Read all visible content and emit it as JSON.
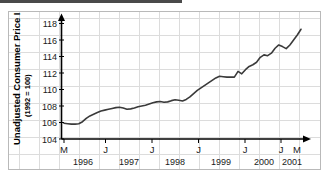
{
  "chart_data": {
    "type": "line",
    "title": "",
    "xlabel": "",
    "ylabel": "Unadjusted Consumer Price Index",
    "ylabel_sub": "(1992 = 100)",
    "ylim": [
      104,
      118
    ],
    "yticks": [
      104,
      106,
      108,
      110,
      112,
      114,
      116,
      118
    ],
    "ytick_labels": [
      "104",
      "106",
      "108",
      "110",
      "112",
      "114",
      "116",
      "118"
    ],
    "grid": true,
    "legend": "none",
    "x_start_label": "M",
    "x_end_label": "M",
    "xtick_labels": [
      "M",
      "J",
      "J",
      "J",
      "J",
      "J",
      "M"
    ],
    "xyear_labels": [
      "1996",
      "1997",
      "1998",
      "1999",
      "2000",
      "2001"
    ],
    "x_axis_note": "Monthly observations from May 1996 through May 2001; M = May, J = January",
    "x_months": [
      "1996-05",
      "1996-06",
      "1996-07",
      "1996-08",
      "1996-09",
      "1996-10",
      "1996-11",
      "1996-12",
      "1997-01",
      "1997-02",
      "1997-03",
      "1997-04",
      "1997-05",
      "1997-06",
      "1997-07",
      "1997-08",
      "1997-09",
      "1997-10",
      "1997-11",
      "1997-12",
      "1998-01",
      "1998-02",
      "1998-03",
      "1998-04",
      "1998-05",
      "1998-06",
      "1998-07",
      "1998-08",
      "1998-09",
      "1998-10",
      "1998-11",
      "1998-12",
      "1999-01",
      "1999-02",
      "1999-03",
      "1999-04",
      "1999-05",
      "1999-06",
      "1999-07",
      "1999-08",
      "1999-09",
      "1999-10",
      "1999-11",
      "1999-12",
      "2000-01",
      "2000-02",
      "2000-03",
      "2000-04",
      "2000-05",
      "2000-06",
      "2000-07",
      "2000-08",
      "2000-09",
      "2000-10",
      "2000-11",
      "2000-12",
      "2001-01",
      "2001-02",
      "2001-03",
      "2001-04",
      "2001-05"
    ],
    "values": [
      105.9,
      105.85,
      105.8,
      105.8,
      105.85,
      106.1,
      106.5,
      106.8,
      107.0,
      107.2,
      107.4,
      107.5,
      107.6,
      107.7,
      107.8,
      107.85,
      107.75,
      107.6,
      107.65,
      107.75,
      107.9,
      108.0,
      108.1,
      108.25,
      108.4,
      108.5,
      108.55,
      108.45,
      108.5,
      108.65,
      108.75,
      108.7,
      108.6,
      108.8,
      109.1,
      109.5,
      109.9,
      110.2,
      110.5,
      110.8,
      111.1,
      111.4,
      111.6,
      111.55,
      111.5,
      111.5,
      111.5,
      112.2,
      111.9,
      112.4,
      112.8,
      113.0,
      113.3,
      113.9,
      114.2,
      114.1,
      114.4,
      115.0,
      115.4,
      115.2,
      114.95
    ],
    "values_tail": [
      115.4,
      116.0,
      116.6,
      117.3
    ],
    "y_min_observed": 105.8,
    "y_max_observed": 117.3,
    "line_color": "#3a3a3a",
    "grid_color": "#dcdcdc",
    "axis_color": "#000000"
  }
}
